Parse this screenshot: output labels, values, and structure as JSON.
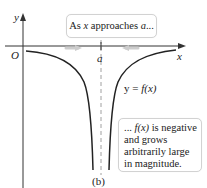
{
  "figure": {
    "caption": "(b)",
    "axes": {
      "x_label": "x",
      "y_label": "y",
      "origin_label": "O",
      "asymptote_label": "a"
    },
    "curve_label": {
      "prefix": "y = ",
      "func": "f(x)"
    },
    "callouts": {
      "top": {
        "pre": "As ",
        "var": "x",
        "mid": " approaches ",
        "target": "a",
        "post": "..."
      },
      "right": {
        "line1_pre": "... ",
        "line1_func": "f(x)",
        "line1_post": " is negative",
        "line2": "and grows",
        "line3": "arbitrarily large",
        "line4": "in magnitude."
      }
    },
    "colors": {
      "curve": "#222222",
      "axis": "#333333",
      "asymptote": "#888888",
      "approach_arrows": "#cccccc",
      "callout_border": "#d2d2d2"
    }
  }
}
